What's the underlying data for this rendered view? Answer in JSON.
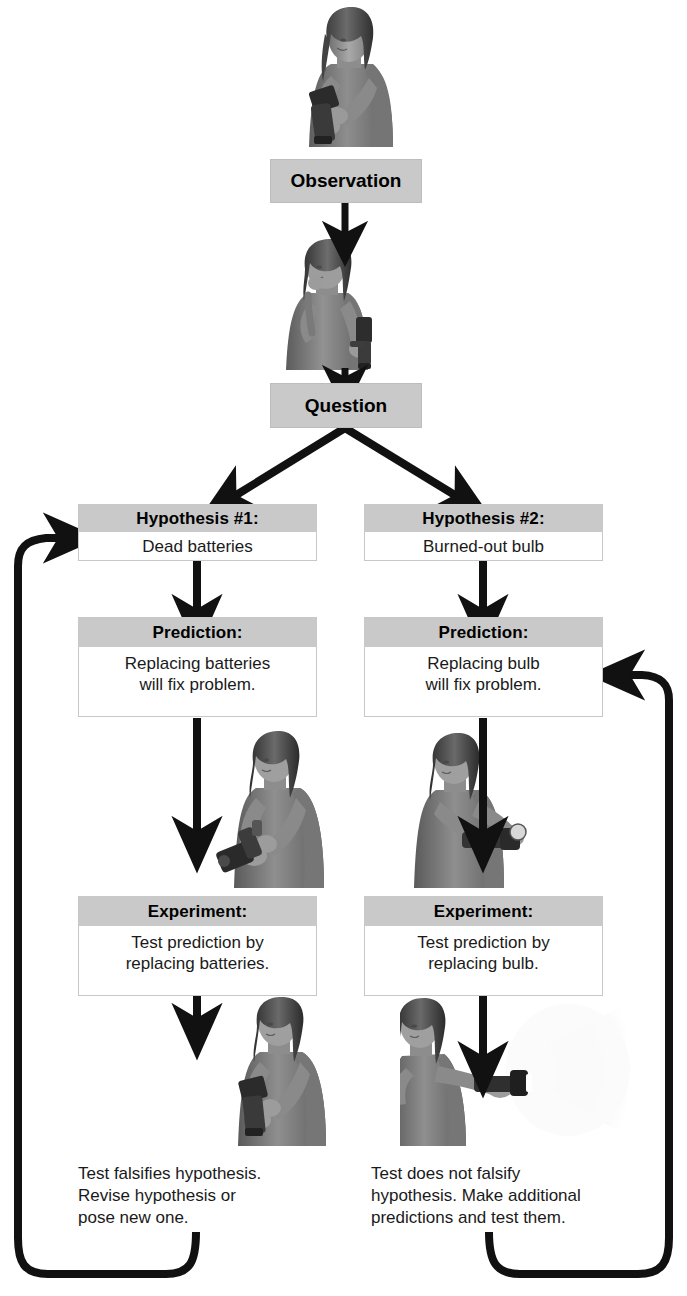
{
  "diagram": {
    "theme": {
      "header_gray": "#c9c9c9",
      "body_white": "#ffffff",
      "border_gray": "#c8c8c8",
      "arrow_black": "#111111",
      "text_black": "#1a1a1a"
    },
    "nodes": {
      "observation": {
        "label": "Observation"
      },
      "question": {
        "label": "Question"
      },
      "hypothesis_1": {
        "header": "Hypothesis #1:",
        "body": "Dead batteries"
      },
      "hypothesis_2": {
        "header": "Hypothesis #2:",
        "body": "Burned-out bulb"
      },
      "prediction_1": {
        "header": "Prediction:",
        "body": "Replacing batteries\nwill fix problem."
      },
      "prediction_2": {
        "header": "Prediction:",
        "body": "Replacing bulb\nwill fix problem."
      },
      "experiment_1": {
        "header": "Experiment:",
        "body": "Test prediction by\nreplacing batteries."
      },
      "experiment_2": {
        "header": "Experiment:",
        "body": "Test prediction by\nreplacing bulb."
      },
      "result_1": {
        "text": "Test falsifies hypothesis.\nRevise hypothesis or\npose new one."
      },
      "result_2": {
        "text": "Test does not falsify\nhypothesis. Make additional\npredictions and test them."
      }
    },
    "illustrations": [
      {
        "name": "woman-shaking-flashlight",
        "caption": "Woman holding and shaking a flashlight that will not light"
      },
      {
        "name": "woman-thinking-with-flashlight",
        "caption": "Woman with hand to chin, thinking, holding flashlight"
      },
      {
        "name": "woman-replacing-batteries",
        "caption": "Woman opening flashlight to replace batteries"
      },
      {
        "name": "woman-replacing-bulb",
        "caption": "Woman replacing the bulb in the flashlight head"
      },
      {
        "name": "woman-flashlight-still-dark",
        "caption": "Woman holding flashlight that is still not working"
      },
      {
        "name": "woman-flashlight-shining",
        "caption": "Woman holding flashlight with beam of light shining"
      }
    ],
    "edges": [
      {
        "name": "observation-to-question",
        "from": "observation",
        "to": "question",
        "style": "straight-down"
      },
      {
        "name": "question-to-hypothesis-1",
        "from": "question",
        "to": "hypothesis_1",
        "style": "diagonal-left"
      },
      {
        "name": "question-to-hypothesis-2",
        "from": "question",
        "to": "hypothesis_2",
        "style": "diagonal-right"
      },
      {
        "name": "hypothesis-1-to-prediction-1",
        "from": "hypothesis_1",
        "to": "prediction_1",
        "style": "straight-down"
      },
      {
        "name": "hypothesis-2-to-prediction-2",
        "from": "hypothesis_2",
        "to": "prediction_2",
        "style": "straight-down"
      },
      {
        "name": "prediction-1-to-experiment-1",
        "from": "prediction_1",
        "to": "experiment_1",
        "style": "straight-down"
      },
      {
        "name": "prediction-2-to-experiment-2",
        "from": "prediction_2",
        "to": "experiment_2",
        "style": "straight-down"
      },
      {
        "name": "experiment-1-to-result-1",
        "from": "experiment_1",
        "to": "result_1",
        "style": "straight-down"
      },
      {
        "name": "experiment-2-to-result-2",
        "from": "experiment_2",
        "to": "result_2",
        "style": "straight-down"
      },
      {
        "name": "feedback-loop-left",
        "from": "result_1",
        "to": "hypothesis_1",
        "style": "u-turn-left"
      },
      {
        "name": "feedback-loop-right",
        "from": "result_2",
        "to": "prediction_2",
        "style": "u-turn-right"
      }
    ]
  }
}
